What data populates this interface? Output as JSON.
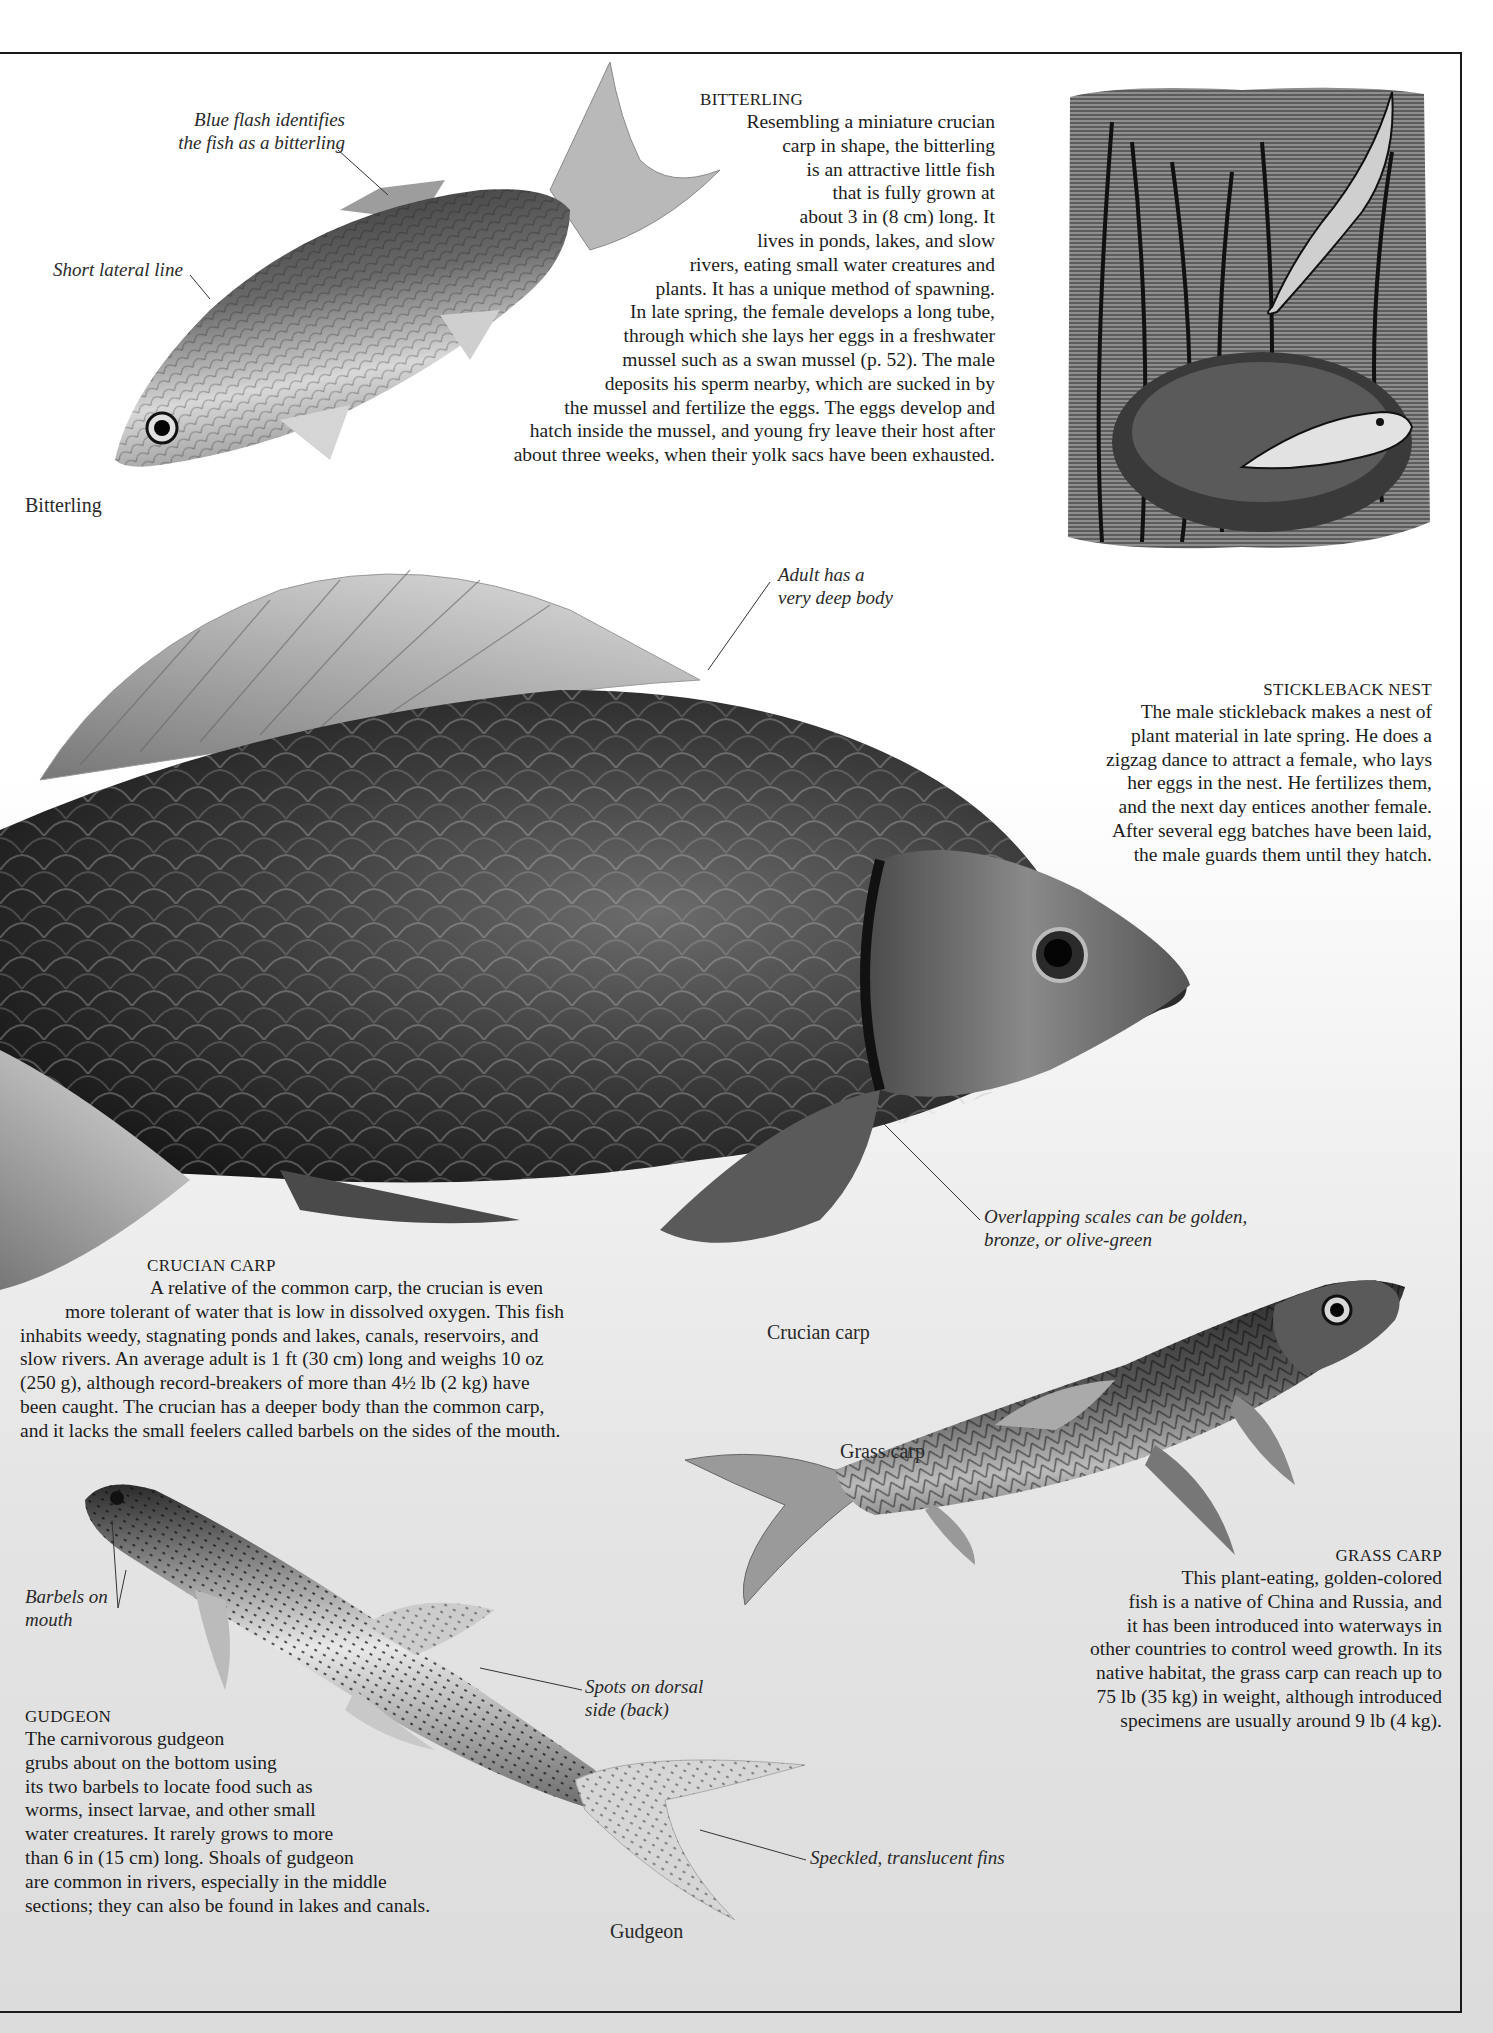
{
  "page": {
    "background": "#ffffff",
    "text_color": "#1c1c1c",
    "rule_color": "#1a1a1a"
  },
  "bitterling": {
    "heading": "BITTERLING",
    "lines": [
      "Resembling a miniature crucian",
      "carp in shape, the bitterling",
      "is an attractive little fish",
      "that is fully grown at",
      "about 3 in (8 cm) long. It",
      "lives in ponds, lakes, and slow",
      "rivers, eating small water creatures and",
      "plants. It has a unique method of spawning.",
      "In late spring, the female develops a long tube,",
      "through which she lays her eggs in a freshwater",
      "mussel such as a swan mussel (p. 52). The male",
      "deposits his sperm nearby, which are sucked in by",
      "the mussel and fertilize the eggs. The eggs develop and",
      "hatch inside the mussel, and young fry leave their host after",
      "about three weeks, when their yolk sacs have been exhausted."
    ],
    "label_blue_flash": [
      "Blue flash identifies",
      "the fish as a bitterling"
    ],
    "label_lateral_line": "Short lateral line",
    "caption": "Bitterling"
  },
  "stickleback": {
    "heading": "STICKLEBACK NEST",
    "lines": [
      "The male stickleback makes a nest of",
      "plant material in late spring. He does a",
      "zigzag dance to attract a female, who lays",
      "her eggs in the nest. He fertilizes them,",
      "and the next day entices another female.",
      "After several egg batches have been laid,",
      "the male guards them until they hatch."
    ]
  },
  "crucian": {
    "heading": "CRUCIAN CARP",
    "lines": [
      "A relative of the common carp, the crucian is even",
      "more tolerant of water that is low in dissolved oxygen. This fish",
      "inhabits weedy, stagnating ponds and lakes, canals, reservoirs, and",
      "slow rivers. An average adult is 1 ft (30 cm) long and weighs 10 oz",
      "(250 g), although record-breakers of more than 4½ lb (2 kg) have",
      "been caught. The crucian has a deeper body than the common carp,",
      "and it lacks the small feelers called barbels on the sides of the mouth."
    ],
    "label_deep_body": [
      "Adult has a",
      "very deep body"
    ],
    "label_scales": [
      "Overlapping scales can be golden,",
      "bronze, or olive-green"
    ],
    "caption": "Crucian carp"
  },
  "grass_carp": {
    "heading": "GRASS CARP",
    "lines": [
      "This plant-eating, golden-colored",
      "fish is a native of China and Russia, and",
      "it has been introduced into waterways in",
      "other countries to control weed growth. In its",
      "native habitat, the grass carp can reach up to",
      "75 lb (35 kg) in weight, although introduced",
      "specimens are usually around 9 lb (4 kg)."
    ],
    "caption": "Grass carp"
  },
  "gudgeon": {
    "heading": "GUDGEON",
    "lines": [
      "The carnivorous gudgeon",
      "grubs about on the bottom using",
      "its two barbels to locate food such as",
      "worms, insect larvae, and other small",
      "water creatures. It rarely grows to more",
      "than 6 in (15 cm) long. Shoals of gudgeon",
      "are common in rivers, especially in the middle",
      "sections; they can also be found in lakes and canals."
    ],
    "label_barbels": [
      "Barbels on",
      "mouth"
    ],
    "label_spots": [
      "Spots on dorsal",
      "side (back)"
    ],
    "label_fins": "Speckled, translucent fins",
    "caption": "Gudgeon"
  }
}
